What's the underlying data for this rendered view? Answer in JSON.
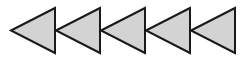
{
  "diagram": {
    "shape": "triangle-left",
    "count": 5,
    "fill_color": "#d3d3d3",
    "stroke_color": "#1a1a1a",
    "stroke_width": 2,
    "triangles": [
      {
        "tip_x": 11,
        "base_x": 55,
        "top_y": 8,
        "bottom_y": 53,
        "mid_y": 30.5
      },
      {
        "tip_x": 56,
        "base_x": 100,
        "top_y": 8,
        "bottom_y": 53,
        "mid_y": 30.5
      },
      {
        "tip_x": 101,
        "base_x": 145,
        "top_y": 8,
        "bottom_y": 53,
        "mid_y": 30.5
      },
      {
        "tip_x": 146,
        "base_x": 190,
        "top_y": 8,
        "bottom_y": 53,
        "mid_y": 30.5
      },
      {
        "tip_x": 191,
        "base_x": 235,
        "top_y": 8,
        "bottom_y": 53,
        "mid_y": 30.5
      }
    ]
  }
}
